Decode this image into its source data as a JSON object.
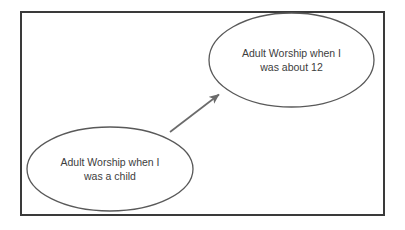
{
  "diagram": {
    "background_color": "#ffffff",
    "frame": {
      "name": "outer-border",
      "color": "#3a3a3a",
      "stroke_width": 2,
      "x": 20,
      "y": 11,
      "width": 365,
      "height": 205
    },
    "node_stroke_color": "#595959",
    "node_fill_color": "#ffffff",
    "text_color": "#3d3d3d",
    "connector_color": "#6b6b6b",
    "nodes": [
      {
        "id": "adult-worship-about-12",
        "shape": "ellipse",
        "cx": 291.5,
        "cy": 60,
        "rx": 82.5,
        "ry": 47,
        "lines": [
          "Adult Worship when I",
          "was about 12"
        ]
      },
      {
        "id": "adult-worship-as-child",
        "shape": "ellipse",
        "cx": 110,
        "cy": 169,
        "rx": 83,
        "ry": 42,
        "lines": [
          "Adult Worship when I",
          "was a child"
        ]
      }
    ],
    "connectors": [
      {
        "id": "child-to-twelve-arrow",
        "type": "arrow",
        "from_node": "adult-worship-as-child",
        "to_node": "adult-worship-about-12",
        "x1": 170,
        "y1": 132,
        "x2": 222,
        "y2": 92,
        "stroke_width": 1.6,
        "arrowhead": "solid-triangle"
      }
    ]
  }
}
